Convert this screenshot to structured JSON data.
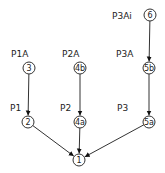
{
  "diagram": {
    "type": "tree",
    "colors": {
      "line": "#333333",
      "text": "#222222",
      "background": "#ffffff"
    },
    "nodes": [
      {
        "id": "1",
        "label": "1",
        "cx": 79,
        "cy": 160
      },
      {
        "id": "2",
        "label": "2",
        "cx": 28,
        "cy": 122
      },
      {
        "id": "4a",
        "label": "4a",
        "cx": 80,
        "cy": 122
      },
      {
        "id": "5a",
        "label": "5a",
        "cx": 149,
        "cy": 122
      },
      {
        "id": "3",
        "label": "3",
        "cx": 29,
        "cy": 68
      },
      {
        "id": "4b",
        "label": "4b",
        "cx": 80,
        "cy": 68
      },
      {
        "id": "5b",
        "label": "5b",
        "cx": 149,
        "cy": 68
      },
      {
        "id": "6",
        "label": "6",
        "cx": 150,
        "cy": 15
      }
    ],
    "labels": [
      {
        "text": "P3Ai",
        "x": 112,
        "y": 19
      },
      {
        "text": "P1A",
        "x": 11,
        "y": 57
      },
      {
        "text": "P2A",
        "x": 62,
        "y": 57
      },
      {
        "text": "P3A",
        "x": 116,
        "y": 57
      },
      {
        "text": "P1",
        "x": 10,
        "y": 111
      },
      {
        "text": "P2",
        "x": 60,
        "y": 111
      },
      {
        "text": "P3",
        "x": 117,
        "y": 111
      }
    ],
    "edges": [
      {
        "from": "6",
        "to": "5b"
      },
      {
        "from": "3",
        "to": "2"
      },
      {
        "from": "4b",
        "to": "4a"
      },
      {
        "from": "5b",
        "to": "5a"
      },
      {
        "from": "2",
        "to": "1"
      },
      {
        "from": "4a",
        "to": "1"
      },
      {
        "from": "5a",
        "to": "1"
      }
    ]
  }
}
